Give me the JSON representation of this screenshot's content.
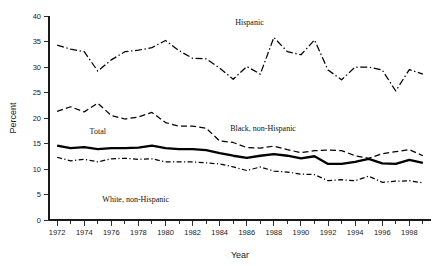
{
  "chart_data": {
    "type": "line",
    "title": "",
    "xlabel": "Year",
    "ylabel": "Percent",
    "xlim": [
      1971.4,
      1999.6
    ],
    "ylim": [
      0,
      40
    ],
    "grid": false,
    "legend_position": "inline-annotations",
    "x_major_ticks": [
      1972,
      1974,
      1976,
      1978,
      1980,
      1982,
      1984,
      1986,
      1988,
      1990,
      1992,
      1994,
      1996,
      1998
    ],
    "x_minor_ticks": [
      1973,
      1975,
      1977,
      1979,
      1981,
      1983,
      1985,
      1987,
      1989,
      1991,
      1993,
      1995,
      1997,
      1999
    ],
    "y_ticks": [
      0,
      5,
      10,
      15,
      20,
      25,
      30,
      35,
      40
    ],
    "x": [
      1972,
      1973,
      1974,
      1975,
      1976,
      1977,
      1978,
      1979,
      1980,
      1981,
      1982,
      1983,
      1984,
      1985,
      1986,
      1987,
      1988,
      1989,
      1990,
      1991,
      1992,
      1993,
      1994,
      1995,
      1996,
      1997,
      1998,
      1999
    ],
    "series": [
      {
        "name": "Hispanic",
        "line_style": "dash-dot",
        "values": [
          34.3,
          33.5,
          33.0,
          29.2,
          31.4,
          33.0,
          33.3,
          33.8,
          35.2,
          33.2,
          31.7,
          31.6,
          29.8,
          27.6,
          30.1,
          28.6,
          35.8,
          33.0,
          32.4,
          35.3,
          29.4,
          27.5,
          30.0,
          30.0,
          29.4,
          25.3,
          29.5,
          28.6
        ]
      },
      {
        "name": "Black, non-Hispanic",
        "line_style": "dashed",
        "values": [
          21.3,
          22.2,
          21.2,
          22.9,
          20.5,
          19.8,
          20.2,
          21.1,
          19.1,
          18.4,
          18.4,
          18.0,
          15.5,
          15.2,
          14.2,
          14.1,
          14.5,
          13.8,
          13.2,
          13.6,
          13.7,
          13.6,
          12.6,
          12.1,
          13.0,
          13.4,
          13.8,
          12.6
        ]
      },
      {
        "name": "Total",
        "line_style": "solid",
        "values": [
          14.6,
          14.1,
          14.3,
          13.9,
          14.1,
          14.1,
          14.2,
          14.6,
          14.1,
          13.9,
          13.9,
          13.7,
          13.1,
          12.6,
          12.2,
          12.6,
          12.9,
          12.6,
          12.1,
          12.5,
          11.0,
          11.0,
          11.4,
          12.0,
          11.1,
          11.0,
          11.8,
          11.2
        ]
      },
      {
        "name": "White, non-Hispanic",
        "line_style": "dash-dot",
        "values": [
          12.3,
          11.6,
          11.9,
          11.4,
          12.0,
          12.1,
          11.9,
          12.0,
          11.4,
          11.4,
          11.4,
          11.2,
          11.0,
          10.4,
          9.7,
          10.4,
          9.6,
          9.4,
          9.0,
          8.9,
          7.7,
          7.9,
          7.7,
          8.6,
          7.4,
          7.6,
          7.7,
          7.3
        ]
      }
    ],
    "annotations": [
      {
        "text": "Hispanic",
        "x": 1986.2,
        "y": 38.2
      },
      {
        "text": "Black, non-Hispanic",
        "x": 1987.2,
        "y": 17.4
      },
      {
        "text": "Total",
        "x": 1975.0,
        "y": 16.8
      },
      {
        "text": "White, non-Hispanic",
        "x": 1977.8,
        "y": 3.6
      }
    ]
  }
}
